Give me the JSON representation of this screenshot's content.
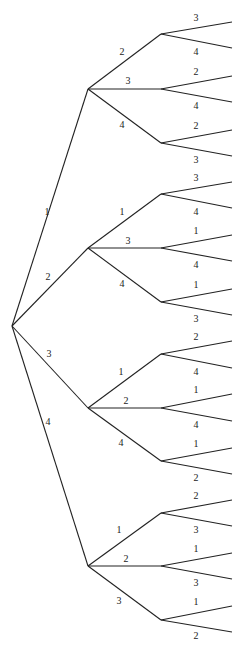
{
  "diagram": {
    "type": "tree",
    "root": {
      "x": 12,
      "y": 326
    },
    "level1_x": 88,
    "level2_x": 161,
    "leaf_x": 232,
    "branches": [
      {
        "label": "1",
        "y": 89,
        "label_pos": {
          "x": 47,
          "y": 215
        },
        "children": [
          {
            "label": "2",
            "y": 34,
            "label_pos": {
              "x": 122,
              "y": 55
            },
            "leaves": [
              {
                "label": "3",
                "y": 22
              },
              {
                "label": "4",
                "y": 48
              }
            ]
          },
          {
            "label": "3",
            "y": 89,
            "label_pos": {
              "x": 128,
              "y": 84
            },
            "leaves": [
              {
                "label": "2",
                "y": 76
              },
              {
                "label": "4",
                "y": 102
              }
            ]
          },
          {
            "label": "4",
            "y": 143,
            "label_pos": {
              "x": 122,
              "y": 128
            },
            "leaves": [
              {
                "label": "2",
                "y": 130
              },
              {
                "label": "3",
                "y": 156
              }
            ]
          }
        ]
      },
      {
        "label": "2",
        "y": 248,
        "label_pos": {
          "x": 48,
          "y": 280
        },
        "children": [
          {
            "label": "1",
            "y": 194,
            "label_pos": {
              "x": 122,
              "y": 215
            },
            "leaves": [
              {
                "label": "3",
                "y": 182
              },
              {
                "label": "4",
                "y": 208
              }
            ]
          },
          {
            "label": "3",
            "y": 248,
            "label_pos": {
              "x": 128,
              "y": 244
            },
            "leaves": [
              {
                "label": "1",
                "y": 235
              },
              {
                "label": "4",
                "y": 261
              }
            ]
          },
          {
            "label": "4",
            "y": 302,
            "label_pos": {
              "x": 122,
              "y": 287
            },
            "leaves": [
              {
                "label": "1",
                "y": 289
              },
              {
                "label": "3",
                "y": 315
              }
            ]
          }
        ]
      },
      {
        "label": "3",
        "y": 408,
        "label_pos": {
          "x": 49,
          "y": 357
        },
        "children": [
          {
            "label": "1",
            "y": 354,
            "label_pos": {
              "x": 121,
              "y": 375
            },
            "leaves": [
              {
                "label": "2",
                "y": 341
              },
              {
                "label": "4",
                "y": 368
              }
            ]
          },
          {
            "label": "2",
            "y": 408,
            "label_pos": {
              "x": 126,
              "y": 404
            },
            "leaves": [
              {
                "label": "1",
                "y": 394
              },
              {
                "label": "4",
                "y": 421
              }
            ]
          },
          {
            "label": "4",
            "y": 461,
            "label_pos": {
              "x": 121,
              "y": 446
            },
            "leaves": [
              {
                "label": "1",
                "y": 448
              },
              {
                "label": "2",
                "y": 474
              }
            ]
          }
        ]
      },
      {
        "label": "4",
        "y": 566,
        "label_pos": {
          "x": 48,
          "y": 425
        },
        "children": [
          {
            "label": "1",
            "y": 513,
            "label_pos": {
              "x": 119,
              "y": 533
            },
            "leaves": [
              {
                "label": "2",
                "y": 500
              },
              {
                "label": "3",
                "y": 526
              }
            ]
          },
          {
            "label": "2",
            "y": 566,
            "label_pos": {
              "x": 126,
              "y": 562
            },
            "leaves": [
              {
                "label": "1",
                "y": 553
              },
              {
                "label": "3",
                "y": 579
              }
            ]
          },
          {
            "label": "3",
            "y": 620,
            "label_pos": {
              "x": 119,
              "y": 604
            },
            "leaves": [
              {
                "label": "1",
                "y": 606
              },
              {
                "label": "2",
                "y": 632
              }
            ]
          }
        ]
      }
    ]
  }
}
